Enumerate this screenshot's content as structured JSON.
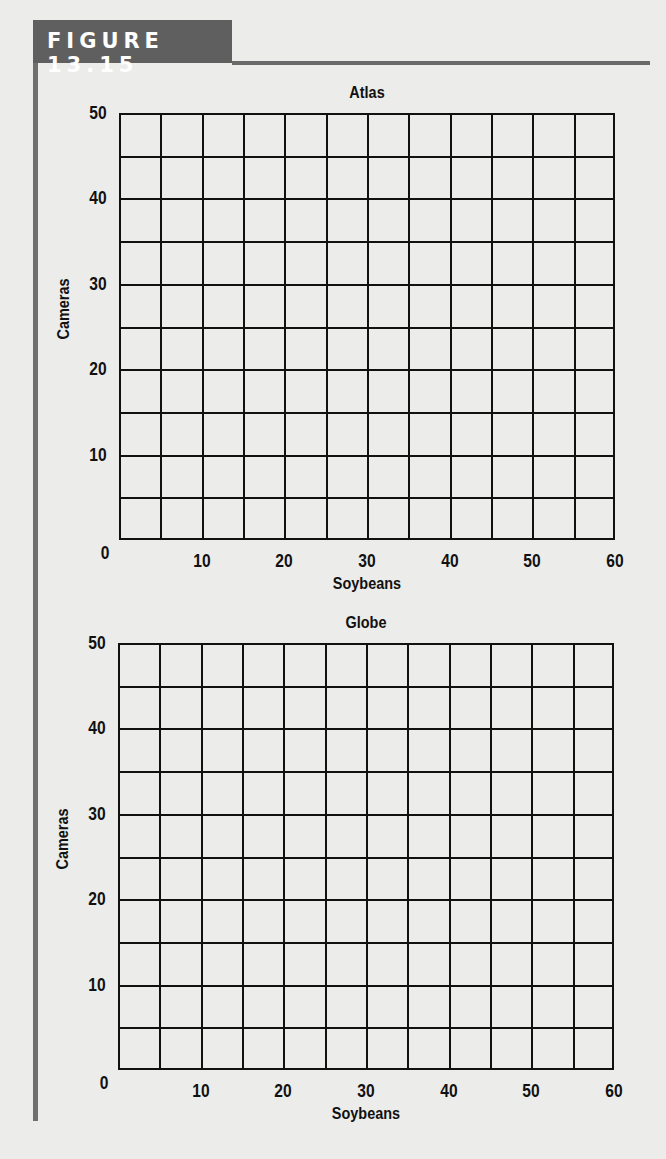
{
  "figure": {
    "label": "FIGURE 13.15"
  },
  "chart_data": [
    {
      "type": "scatter",
      "title": "Atlas",
      "xlabel": "Soybeans",
      "ylabel": "Cameras",
      "xlim": [
        0,
        60
      ],
      "ylim": [
        0,
        50
      ],
      "x_ticks": [
        "0",
        "10",
        "20",
        "30",
        "40",
        "50",
        "60"
      ],
      "y_ticks": [
        "10",
        "20",
        "30",
        "40",
        "50"
      ],
      "grid": true,
      "grid_x_step": 5,
      "grid_y_step": 5,
      "series": []
    },
    {
      "type": "scatter",
      "title": "Globe",
      "xlabel": "Soybeans",
      "ylabel": "Cameras",
      "xlim": [
        0,
        60
      ],
      "ylim": [
        0,
        50
      ],
      "x_ticks": [
        "0",
        "10",
        "20",
        "30",
        "40",
        "50",
        "60"
      ],
      "y_ticks": [
        "10",
        "20",
        "30",
        "40",
        "50"
      ],
      "grid": true,
      "grid_x_step": 5,
      "grid_y_step": 5,
      "series": []
    }
  ]
}
